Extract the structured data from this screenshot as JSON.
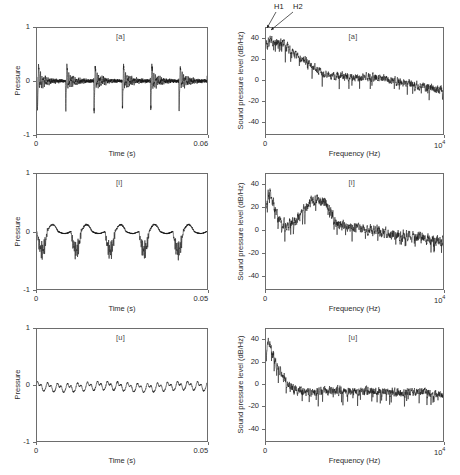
{
  "figure": {
    "width": 460,
    "height": 475,
    "background": "#ffffff",
    "line_color": "#1a1a1a",
    "axis_color": "#6d6d6d"
  },
  "annotations": {
    "h1_label": "H1",
    "h2_label": "H2"
  },
  "panels": [
    {
      "id": "waveform-a",
      "kind": "waveform",
      "letter": "[a]",
      "ylabel": "Pressure",
      "xlabel": "Time (s)",
      "yticks": [
        "1",
        "0",
        "-1"
      ],
      "ytick_values": [
        1,
        0,
        -1
      ],
      "xticks": [
        "0",
        "0.06"
      ],
      "xtick_values": [
        0,
        0.06
      ],
      "xlim": [
        0,
        0.06
      ],
      "ylim": [
        -1,
        1
      ],
      "box": {
        "left": 36,
        "top": 27,
        "width": 172,
        "height": 108
      }
    },
    {
      "id": "spectrum-a",
      "kind": "spectrum",
      "letter": "[a]",
      "ylabel": "Sound pressure level (dB/Hz)",
      "xlabel": "Frequency (Hz)",
      "yticks": [
        "40",
        "20",
        "0",
        "-20",
        "-40"
      ],
      "ytick_values": [
        40,
        20,
        0,
        -20,
        -40
      ],
      "xticks": [
        "0",
        "10^4"
      ],
      "xtick_values": [
        0,
        10000
      ],
      "xlim": [
        0,
        10000
      ],
      "ylim": [
        -52,
        50
      ],
      "box": {
        "left": 265,
        "top": 27,
        "width": 179,
        "height": 108
      },
      "has_harmonic_labels": true
    },
    {
      "id": "waveform-i",
      "kind": "waveform",
      "letter": "[i]",
      "ylabel": "Pressure",
      "xlabel": "Time (s)",
      "yticks": [
        "1",
        "0",
        "-1"
      ],
      "ytick_values": [
        1,
        0,
        -1
      ],
      "xticks": [
        "0",
        "0.05"
      ],
      "xtick_values": [
        0,
        0.05
      ],
      "xlim": [
        0,
        0.05
      ],
      "ylim": [
        -1,
        1
      ],
      "box": {
        "left": 36,
        "top": 173,
        "width": 172,
        "height": 117
      }
    },
    {
      "id": "spectrum-i",
      "kind": "spectrum",
      "letter": "[i]",
      "ylabel": "Sound pressure level (dB/Hz)",
      "xlabel": "Frequency (Hz)",
      "yticks": [
        "40",
        "20",
        "0",
        "-20",
        "-40"
      ],
      "ytick_values": [
        40,
        20,
        0,
        -20,
        -40
      ],
      "xticks": [
        "0",
        "10^4"
      ],
      "xtick_values": [
        0,
        10000
      ],
      "xlim": [
        0,
        10000
      ],
      "ylim": [
        -52,
        50
      ],
      "box": {
        "left": 265,
        "top": 173,
        "width": 179,
        "height": 117
      }
    },
    {
      "id": "waveform-u",
      "kind": "waveform",
      "letter": "[u]",
      "ylabel": "Pressure",
      "xlabel": "Time (s)",
      "yticks": [
        "1",
        "0",
        "-1"
      ],
      "ytick_values": [
        1,
        0,
        -1
      ],
      "xticks": [
        "0",
        "0.05"
      ],
      "xtick_values": [
        0,
        0.05
      ],
      "xlim": [
        0,
        0.05
      ],
      "ylim": [
        -1,
        1
      ],
      "box": {
        "left": 36,
        "top": 328,
        "width": 172,
        "height": 114
      }
    },
    {
      "id": "spectrum-u",
      "kind": "spectrum",
      "letter": "[u]",
      "ylabel": "Sound pressure level (dB/Hz)",
      "xlabel": "Frequency (Hz)",
      "yticks": [
        "40",
        "20",
        "0",
        "-20",
        "-40"
      ],
      "ytick_values": [
        40,
        20,
        0,
        -20,
        -40
      ],
      "xticks": [
        "0",
        "10^4"
      ],
      "xtick_values": [
        0,
        10000
      ],
      "xlim": [
        0,
        10000
      ],
      "ylim": [
        -52,
        50
      ],
      "box": {
        "left": 265,
        "top": 328,
        "width": 179,
        "height": 114
      }
    }
  ],
  "chart_data": [
    {
      "type": "line",
      "id": "waveform-a",
      "title": "[a]",
      "xlabel": "Time (s)",
      "ylabel": "Pressure",
      "xlim": [
        0,
        0.06
      ],
      "ylim": [
        -1,
        1
      ],
      "xticks": [
        0,
        0.06
      ],
      "yticks": [
        -1,
        0,
        1
      ],
      "grid": false,
      "description": "Acoustic pressure waveform of vowel [a]: quasi-periodic glottal pulse train, 6 periods over 0.06 s (F0 approx 100 Hz), sharp negative spikes reaching -0.45 to -0.7 followed by damped formant ringing of amplitude ~0.15.",
      "fundamental_hz": 100,
      "n_periods": 6,
      "peak_negative": -0.68,
      "peak_positive": 0.3,
      "ringing_amplitude": 0.15
    },
    {
      "type": "line",
      "id": "spectrum-a",
      "title": "[a]",
      "xlabel": "Frequency (Hz)",
      "ylabel": "Sound pressure level (dB/Hz)",
      "xlim": [
        0,
        10000
      ],
      "ylim": [
        -52,
        50
      ],
      "xticks": [
        0,
        10000
      ],
      "yticks": [
        -40,
        -20,
        0,
        20,
        40
      ],
      "grid": false,
      "annotations": [
        "H1",
        "H2"
      ],
      "description": "Power spectrum of vowel [a]: low-frequency plateau near 36 dB/Hz from 0 to ~1100 Hz containing harmonics H1 and H2, then roll-off through ~20 dB at 2 kHz, noisy floor descending from ~5 dB at 3 kHz to about -10 dB at 10 kHz.",
      "envelope_x": [
        0,
        200,
        500,
        900,
        1150,
        1500,
        2000,
        2400,
        2800,
        3200,
        4000,
        5000,
        6000,
        7000,
        8000,
        9000,
        10000
      ],
      "envelope_y": [
        33,
        37,
        36,
        36,
        35,
        26,
        20,
        17,
        11,
        6,
        4,
        2,
        3,
        0,
        -3,
        -7,
        -9
      ],
      "noise_db": 6,
      "h1_hz": 100,
      "h1_db": 37,
      "h2_hz": 200,
      "h2_db": 37
    },
    {
      "type": "line",
      "id": "waveform-i",
      "title": "[i]",
      "xlabel": "Time (s)",
      "ylabel": "Pressure",
      "xlim": [
        0,
        0.05
      ],
      "ylim": [
        -1,
        1
      ],
      "xticks": [
        0,
        0.05
      ],
      "yticks": [
        -1,
        0,
        1
      ],
      "grid": false,
      "description": "Acoustic pressure waveform of vowel [i]: 5 glottal periods over 0.05 s (F0 approx 100 Hz); each period has a dense dark burst of high-frequency oscillation extending down to about -0.32 with a small positive lobe near +0.1.",
      "fundamental_hz": 100,
      "n_periods": 5,
      "peak_negative": -0.33,
      "peak_positive": 0.12,
      "burst_frequency_hz": 2900
    },
    {
      "type": "line",
      "id": "spectrum-i",
      "title": "[i]",
      "xlabel": "Frequency (Hz)",
      "ylabel": "Sound pressure level (dB/Hz)",
      "xlim": [
        0,
        10000
      ],
      "ylim": [
        -52,
        50
      ],
      "xticks": [
        0,
        10000
      ],
      "yticks": [
        -40,
        -20,
        0,
        20,
        40
      ],
      "grid": false,
      "description": "Power spectrum of vowel [i]: first peak ~33 dB/Hz near 250 Hz (F1), deep valley to ~3 dB around 1200 Hz, broad second peak ~28 dB/Hz centred near 3000 Hz (F2/F3 cluster), then decay to a noisy floor near -8 dB at 10 kHz with deep narrow nulls reaching -30 dB.",
      "envelope_x": [
        0,
        150,
        300,
        600,
        900,
        1200,
        1600,
        2000,
        2300,
        2700,
        3000,
        3300,
        3600,
        4000,
        4600,
        5200,
        6000,
        7000,
        8000,
        9000,
        10000
      ],
      "envelope_y": [
        20,
        32,
        30,
        14,
        5,
        4,
        9,
        14,
        22,
        27,
        28,
        26,
        18,
        7,
        3,
        1,
        0,
        -3,
        -5,
        -7,
        -9
      ],
      "noise_db": 7,
      "peak1_hz": 250,
      "peak1_db": 33,
      "peak2_hz": 3000,
      "peak2_db": 28
    },
    {
      "type": "line",
      "id": "waveform-u",
      "title": "[u]",
      "xlabel": "Time (s)",
      "ylabel": "Pressure",
      "xlim": [
        0,
        0.05
      ],
      "ylim": [
        -1,
        1
      ],
      "xticks": [
        0,
        0.05
      ],
      "yticks": [
        -1,
        0,
        1
      ],
      "grid": false,
      "description": "Acoustic pressure waveform of vowel [u]: low-amplitude smooth quasi-sinusoidal oscillation, about 17 visible cycles over 0.05 s, amplitude roughly +0.07 to -0.13, slightly asymmetric with flat-topped positive lobes.",
      "fundamental_hz": 340,
      "n_periods": 17,
      "peak_negative": -0.14,
      "peak_positive": 0.08
    },
    {
      "type": "line",
      "id": "spectrum-u",
      "title": "[u]",
      "xlabel": "Frequency (Hz)",
      "ylabel": "Sound pressure level (dB/Hz)",
      "xlim": [
        0,
        10000
      ],
      "ylim": [
        -52,
        50
      ],
      "xticks": [
        0,
        10000
      ],
      "yticks": [
        -40,
        -20,
        0,
        20,
        40
      ],
      "grid": false,
      "description": "Power spectrum of vowel [u]: sharp low-frequency peak reaching ~40 dB/Hz below 300 Hz, steep roll-off crossing 0 dB near 1300 Hz, then a flat noisy floor between -5 and -15 dB from 1.5 kHz to 10 kHz with narrow nulls down to -30 dB.",
      "envelope_x": [
        0,
        100,
        200,
        350,
        600,
        900,
        1200,
        1500,
        2000,
        3000,
        4000,
        5000,
        6000,
        7000,
        8000,
        9000,
        10000
      ],
      "envelope_y": [
        30,
        38,
        36,
        28,
        18,
        9,
        1,
        -5,
        -7,
        -7,
        -6,
        -7,
        -6,
        -7,
        -8,
        -8,
        -11
      ],
      "noise_db": 6,
      "peak_hz": 150,
      "peak_db": 40
    }
  ]
}
